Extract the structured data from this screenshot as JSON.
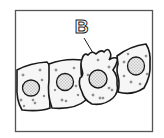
{
  "figure": {
    "label": "B",
    "cell_count": 4,
    "colors": {
      "line": "#1a1a1a",
      "frame": "#555555",
      "cytoplasm": "#f4f4f4",
      "nucleus_fill": "#e6e6e6",
      "background": "#ffffff"
    }
  }
}
